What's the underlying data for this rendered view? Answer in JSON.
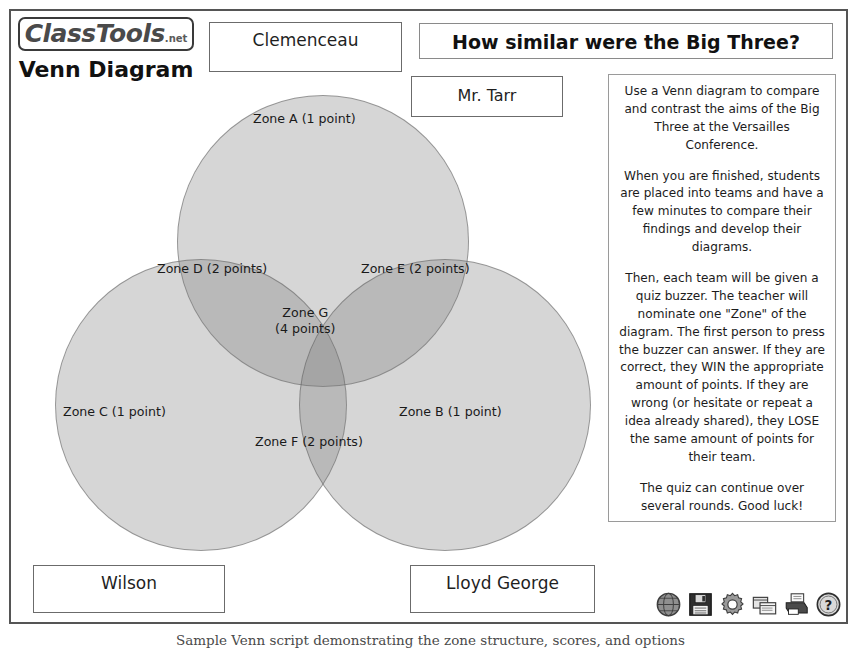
{
  "brand": {
    "logo_main": "ClassTools",
    "logo_suffix": ".net",
    "tool_title": "Venn Diagram"
  },
  "header": {
    "title": "How similar were the Big Three?"
  },
  "labels": {
    "top_circle": "Clemenceau",
    "teacher": "Mr. Tarr",
    "bottom_left_circle": "Wilson",
    "bottom_right_circle": "Lloyd George"
  },
  "instructions": {
    "paragraphs": [
      "Use a Venn diagram to compare and contrast the aims of the Big Three at the Versailles Conference.",
      "When you are finished, students are placed into teams and have a few minutes to compare their findings and develop their diagrams.",
      "Then, each team will be given a quiz buzzer. The teacher will nominate one \"Zone\" of the diagram. The first person to press the buzzer can answer. If they are correct, they WIN the appropriate amount of points. If they are wrong (or hesitate or repeat a idea already shared), they LOSE the same amount of points for their team.",
      "The quiz can continue over several rounds. Good luck!"
    ],
    "p0": "Use a Venn diagram to compare and contrast the aims of the Big Three at the Versailles Conference.",
    "p1": "When you are finished, students are placed into teams and have a few minutes to compare their findings and develop their diagrams.",
    "p2": "Then, each team will be given a quiz buzzer. The teacher will nominate one \"Zone\" of the diagram. The first person to press the buzzer can answer. If they are correct, they WIN the appropriate amount of points. If they are wrong (or hesitate or repeat a idea already shared), they LOSE the same amount of points for their team.",
    "p3": "The quiz can continue over several rounds. Good luck!"
  },
  "venn": {
    "circles": [
      {
        "id": "top",
        "label": "Clemenceau",
        "fill": "#787878",
        "opacity": 0.3
      },
      {
        "id": "left",
        "label": "Wilson",
        "fill": "#787878",
        "opacity": 0.3
      },
      {
        "id": "right",
        "label": "Lloyd George",
        "fill": "#787878",
        "opacity": 0.3
      }
    ],
    "zones": [
      {
        "key": "A",
        "text": "Zone A (1 point)",
        "points": 1,
        "region": "Clemenceau only"
      },
      {
        "key": "B",
        "text": "Zone B (1 point)",
        "points": 1,
        "region": "Lloyd George only"
      },
      {
        "key": "C",
        "text": "Zone C (1 point)",
        "points": 1,
        "region": "Wilson only"
      },
      {
        "key": "D",
        "text": "Zone D (2 points)",
        "points": 2,
        "region": "Clemenceau + Wilson"
      },
      {
        "key": "E",
        "text": "Zone E (2 points)",
        "points": 2,
        "region": "Clemenceau + Lloyd George"
      },
      {
        "key": "F",
        "text": "Zone F (2 points)",
        "points": 2,
        "region": "Wilson + Lloyd George"
      },
      {
        "key": "G",
        "text_line1": "Zone G",
        "text_line2": "(4 points)",
        "points": 4,
        "region": "all three"
      }
    ]
  },
  "toolbar": {
    "icons": [
      {
        "name": "globe-icon",
        "title": "Web"
      },
      {
        "name": "save-icon",
        "title": "Save"
      },
      {
        "name": "gear-icon",
        "title": "Settings"
      },
      {
        "name": "windows-icon",
        "title": "Screens"
      },
      {
        "name": "printer-icon",
        "title": "Print"
      },
      {
        "name": "help-icon",
        "title": "Help"
      }
    ]
  },
  "caption": "Sample Venn script demonstrating the zone structure, scores, and options"
}
